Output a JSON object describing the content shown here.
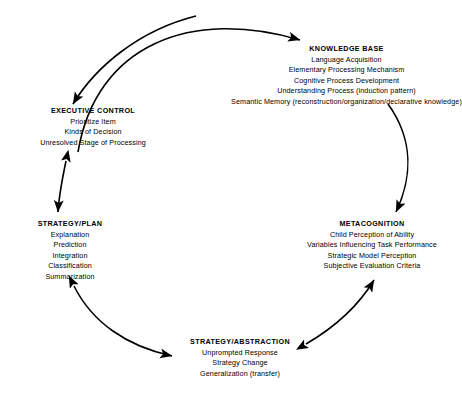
{
  "diagram": {
    "type": "cycle-diagram",
    "line_color": "#000000",
    "background_color": "#ffffff",
    "nodes": [
      {
        "id": "knowledge-base",
        "title": "KNOWLEDGE BASE",
        "items": [
          "Language Acquisition",
          "Elementary Processing Mechanism",
          "Cognitive Process Development",
          "Understanding Process (induction pattern)",
          "Semantic Memory (reconstruction/organization/declarative knowledge)"
        ]
      },
      {
        "id": "executive-control",
        "title": "EXECUTIVE CONTROL",
        "items": [
          "Prioritize Item",
          "Kinds of Decision",
          "Unresolved Stage of Processing"
        ]
      },
      {
        "id": "strategy-plan",
        "title": "STRATEGY/PLAN",
        "items": [
          "Explanation",
          "Prediction",
          "Integration",
          "Classification",
          "Summarization"
        ]
      },
      {
        "id": "metacognition",
        "title": "METACOGNITION",
        "items": [
          "Child Perception of Ability",
          "Variables Influencing Task Performance",
          "Strategic Model Perception",
          "Subjective Evaluation Criteria"
        ]
      },
      {
        "id": "strategy-abstraction",
        "title": "STRATEGY/ABSTRACTION",
        "items": [
          "Unprompted Response",
          "Strategy Change",
          "Generalization (transfer)"
        ]
      }
    ],
    "edges": [
      {
        "id": "top-arc",
        "from": "executive-control",
        "to": "knowledge-base",
        "direction": "one-way"
      },
      {
        "id": "right-arc",
        "from": "knowledge-base",
        "to": "metacognition",
        "direction": "one-way"
      },
      {
        "id": "lower-right-arc",
        "from": "metacognition",
        "to": "strategy-abstraction",
        "direction": "two-way"
      },
      {
        "id": "lower-left-arc",
        "from": "strategy-abstraction",
        "to": "strategy-plan",
        "direction": "two-way"
      },
      {
        "id": "left-link",
        "from": "strategy-plan",
        "to": "executive-control",
        "direction": "two-way"
      }
    ]
  }
}
